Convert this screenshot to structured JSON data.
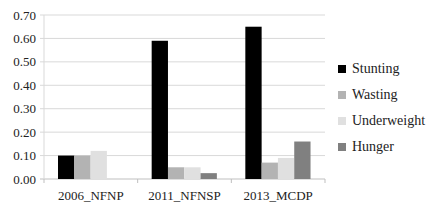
{
  "chart_data": {
    "type": "bar",
    "title": "",
    "xlabel": "",
    "ylabel": "",
    "ylim": [
      0,
      0.7
    ],
    "yticks": [
      "0.00",
      "0.10",
      "0.20",
      "0.30",
      "0.40",
      "0.50",
      "0.60",
      "0.70"
    ],
    "grid": true,
    "legend_position": "right",
    "categories": [
      "2006_NFNP",
      "2011_NFNSP",
      "2013_MCDP"
    ],
    "series": [
      {
        "name": "Stunting",
        "color": "#000000",
        "values": [
          0.1,
          0.59,
          0.65
        ]
      },
      {
        "name": "Wasting",
        "color": "#b3b3b3",
        "values": [
          0.1,
          0.05,
          0.07
        ]
      },
      {
        "name": "Underweight",
        "color": "#e0e0e0",
        "values": [
          0.12,
          0.05,
          0.09
        ]
      },
      {
        "name": "Hunger",
        "color": "#808080",
        "values": [
          0.0,
          0.025,
          0.16
        ]
      }
    ]
  }
}
